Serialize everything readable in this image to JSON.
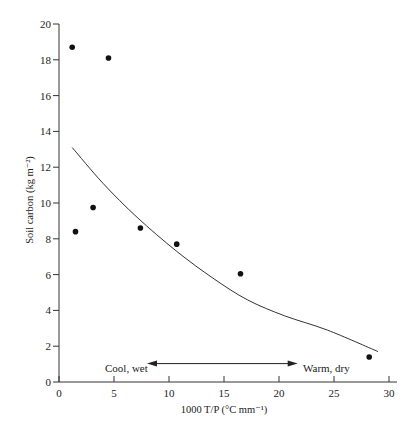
{
  "chart_data": {
    "type": "scatter",
    "title": "",
    "xlabel": "1000 T/P (°C mm⁻¹)",
    "ylabel": "Soil carbon (kg m⁻²)",
    "xlim": [
      0,
      30
    ],
    "ylim": [
      0,
      20
    ],
    "xticks": [
      0,
      5,
      10,
      15,
      20,
      25,
      30
    ],
    "yticks": [
      0,
      2,
      4,
      6,
      8,
      10,
      12,
      14,
      16,
      18,
      20
    ],
    "grid": false,
    "legend": null,
    "series": [
      {
        "name": "observations",
        "kind": "scatter",
        "points": [
          {
            "x": 1.2,
            "y": 18.7
          },
          {
            "x": 4.5,
            "y": 18.1
          },
          {
            "x": 1.5,
            "y": 8.4
          },
          {
            "x": 3.1,
            "y": 9.75
          },
          {
            "x": 7.4,
            "y": 8.6
          },
          {
            "x": 10.7,
            "y": 7.7
          },
          {
            "x": 16.5,
            "y": 6.05
          },
          {
            "x": 28.2,
            "y": 1.4
          }
        ]
      },
      {
        "name": "fitted curve",
        "kind": "line",
        "points": [
          {
            "x": 1.2,
            "y": 13.1
          },
          {
            "x": 4.0,
            "y": 11.1
          },
          {
            "x": 7.1,
            "y": 9.2
          },
          {
            "x": 10.7,
            "y": 7.3
          },
          {
            "x": 14.0,
            "y": 5.8
          },
          {
            "x": 17.1,
            "y": 4.6
          },
          {
            "x": 20.5,
            "y": 3.7
          },
          {
            "x": 24.4,
            "y": 2.9
          },
          {
            "x": 29.0,
            "y": 1.7
          }
        ]
      }
    ],
    "annotations": [
      {
        "text": "Cool, wet",
        "x": 4.2,
        "y": 0.9
      },
      {
        "text": "Warm, dry",
        "x": 22.3,
        "y": 0.9
      }
    ],
    "double_arrow": {
      "x_start": 8.0,
      "x_end": 21.7,
      "y": 1.0
    }
  }
}
